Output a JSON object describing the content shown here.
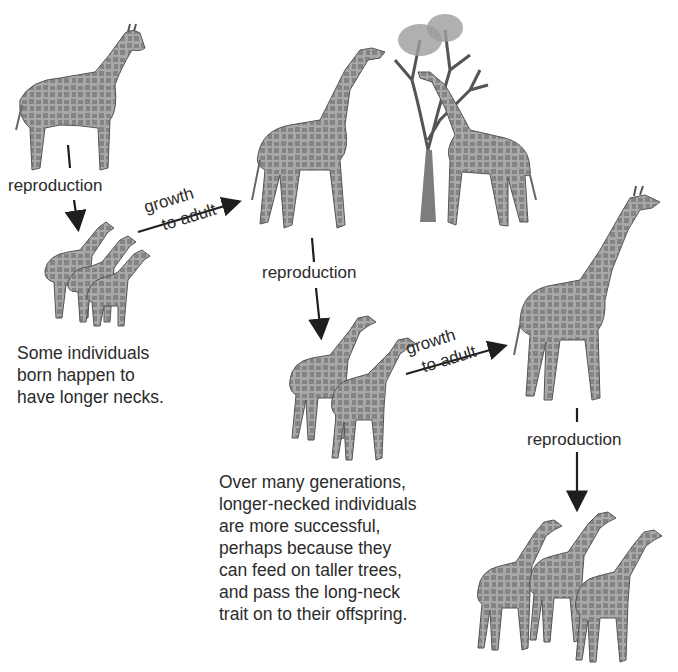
{
  "diagram": {
    "stages": [
      {
        "id": "ancestor",
        "description": "short-necked ancestral giraffe"
      },
      {
        "id": "offspring-1",
        "description": "three young giraffes, varied neck lengths"
      },
      {
        "id": "adults-feeding",
        "description": "two adult giraffes feeding on a tall tree"
      },
      {
        "id": "offspring-2",
        "description": "two young long-necked giraffes"
      },
      {
        "id": "adult-long-neck",
        "description": "single tall long-necked adult giraffe"
      },
      {
        "id": "offspring-3",
        "description": "three long-necked offspring"
      }
    ],
    "arrows": [
      {
        "from": "ancestor",
        "to": "offspring-1",
        "label": "reproduction"
      },
      {
        "from": "offspring-1",
        "to": "adults-feeding",
        "label_line1": "growth",
        "label_line2": "to adult"
      },
      {
        "from": "adults-feeding",
        "to": "offspring-2",
        "label": "reproduction"
      },
      {
        "from": "offspring-2",
        "to": "adult-long-neck",
        "label_line1": "growth",
        "label_line2": "to adult"
      },
      {
        "from": "adult-long-neck",
        "to": "offspring-3",
        "label": "reproduction"
      }
    ],
    "captions": {
      "variation": "Some individuals\nborn happen to\nhave longer necks.",
      "selection": "Over many generations,\nlonger-necked individuals\nare more successful,\nperhaps because they\ncan feed on taller trees,\nand pass the long-neck\ntrait on to their offspring."
    },
    "colors": {
      "ink": "#1e1e1e",
      "giraffe_fill": "#9a9a9a",
      "giraffe_spots": "#6e6e6e",
      "background": "#ffffff"
    }
  }
}
